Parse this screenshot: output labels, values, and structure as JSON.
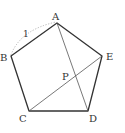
{
  "figure": {
    "type": "regular-pentagon",
    "stroke_color": "#333333",
    "thin_stroke_color": "#555555",
    "dotted_color": "#aaaaaa",
    "vertices": {
      "A": {
        "label": "A",
        "x": 57,
        "y": 23
      },
      "B": {
        "label": "B",
        "x": 11,
        "y": 56
      },
      "C": {
        "label": "C",
        "x": 29,
        "y": 111
      },
      "D": {
        "label": "D",
        "x": 88,
        "y": 111
      },
      "E": {
        "label": "E",
        "x": 102,
        "y": 56
      }
    },
    "intersection": {
      "label": "P",
      "x": 76,
      "y": 74
    },
    "side_label": {
      "text": "1",
      "side": "AB"
    },
    "diagonals": [
      "AD",
      "CE"
    ]
  }
}
